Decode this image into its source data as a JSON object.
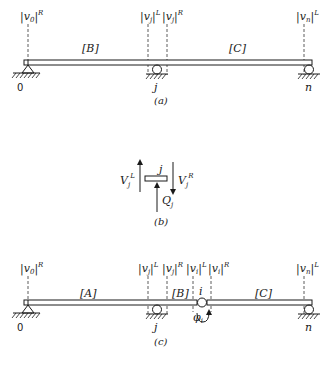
{
  "figure": {
    "panel_a": {
      "caption": "(a)",
      "state_vectors": [
        {
          "base": "|v",
          "sub": "0",
          "close": "|",
          "sup": "R"
        },
        {
          "base": "|v",
          "sub": "j",
          "close": "|",
          "sup": "L"
        },
        {
          "base": "|v",
          "sub": "j",
          "close": "|",
          "sup": "R"
        },
        {
          "base": "|v",
          "sub": "n",
          "close": "|",
          "sup": "L"
        }
      ],
      "segments": [
        "[B]",
        "[C]"
      ],
      "nodes": [
        "0",
        "j",
        "n"
      ]
    },
    "panel_b": {
      "caption": "(b)",
      "node_label": "j",
      "forces": [
        {
          "name": "V",
          "sub": "j",
          "sup": "L",
          "direction": "up"
        },
        {
          "name": "V",
          "sub": "j",
          "sup": "R",
          "direction": "down"
        },
        {
          "name": "Q",
          "sub": "j",
          "direction": "up"
        }
      ]
    },
    "panel_c": {
      "caption": "(c)",
      "state_vectors": [
        {
          "base": "|v",
          "sub": "0",
          "close": "|",
          "sup": "R"
        },
        {
          "base": "|v",
          "sub": "j",
          "close": "|",
          "sup": "L"
        },
        {
          "base": "|v",
          "sub": "j",
          "close": "|",
          "sup": "R"
        },
        {
          "base": "|v",
          "sub": "i",
          "close": "|",
          "sup": "L"
        },
        {
          "base": "|v",
          "sub": "i",
          "close": "|",
          "sup": "R"
        },
        {
          "base": "|v",
          "sub": "n",
          "close": "|",
          "sup": "L"
        }
      ],
      "segments": [
        "[A]",
        "[B]",
        "[C]"
      ],
      "nodes": [
        "0",
        "j",
        "n"
      ],
      "hinge_label": "i",
      "rotation_label": {
        "base": "φ",
        "sub": "i"
      }
    }
  }
}
